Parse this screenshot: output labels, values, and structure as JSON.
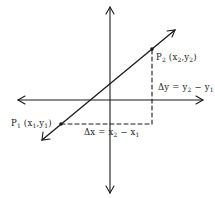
{
  "diagram": {
    "colors": {
      "stroke": "#1a1a1a",
      "text": "#222222",
      "background": "#ffffff"
    },
    "axes": {
      "x_axis": {
        "y": 100,
        "x1": 18,
        "x2": 203,
        "arrows": "both"
      },
      "y_axis": {
        "x": 110,
        "y1": 7,
        "y2": 193,
        "arrows": "both"
      }
    },
    "line": {
      "x1": 42,
      "y1": 140,
      "x2": 175,
      "y2": 30,
      "arrows": "both"
    },
    "points": [
      {
        "id": "P1",
        "x": 61,
        "y": 124,
        "name": "P",
        "sub": "1",
        "coords_open": "(x",
        "coords_sub1": "1",
        "coords_mid": ",y",
        "coords_sub2": "1",
        "coords_close": ")"
      },
      {
        "id": "P2",
        "x": 152,
        "y": 49,
        "name": "P",
        "sub": "2",
        "coords_open": "(x",
        "coords_sub1": "2",
        "coords_mid": ",y",
        "coords_sub2": "2",
        "coords_close": ")"
      }
    ],
    "dashed": {
      "horizontal": {
        "x1": 61,
        "y1": 124,
        "x2": 152,
        "y2": 124
      },
      "vertical": {
        "x1": 152,
        "y1": 124,
        "x2": 152,
        "y2": 49
      }
    },
    "labels": {
      "delta_x": {
        "prefix": "Δx = x",
        "sub1": "2",
        "mid": " − x",
        "sub2": "1"
      },
      "delta_y": {
        "prefix": "Δy = y",
        "sub1": "2",
        "mid": " − y",
        "sub2": "1"
      }
    }
  }
}
